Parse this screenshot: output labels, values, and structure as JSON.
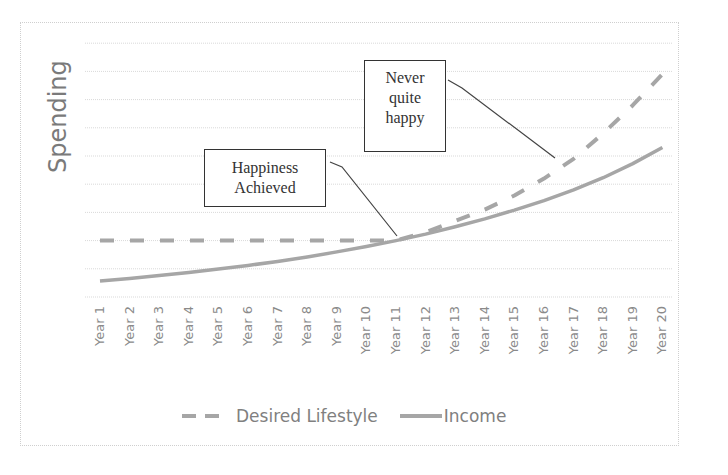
{
  "chart_data": {
    "type": "line",
    "title": "",
    "xlabel": "",
    "ylabel": "Spending",
    "categories": [
      "Year 1",
      "Year 2",
      "Year 3",
      "Year 4",
      "Year 5",
      "Year 6",
      "Year 7",
      "Year 8",
      "Year 9",
      "Year 10",
      "Year 11",
      "Year 12",
      "Year 13",
      "Year 14",
      "Year 15",
      "Year 16",
      "Year 17",
      "Year 18",
      "Year 19",
      "Year 20"
    ],
    "series": [
      {
        "name": "Desired Lifestyle",
        "style": "dashed",
        "color": "#a6a6a6",
        "values": [
          2.0,
          2.0,
          2.0,
          2.0,
          2.0,
          2.0,
          2.0,
          2.0,
          2.0,
          2.0,
          2.0,
          2.3,
          2.7,
          3.1,
          3.6,
          4.2,
          4.9,
          5.8,
          6.8,
          7.9
        ]
      },
      {
        "name": "Income",
        "style": "solid",
        "color": "#a6a6a6",
        "values": [
          0.57,
          0.66,
          0.76,
          0.87,
          0.99,
          1.12,
          1.26,
          1.42,
          1.6,
          1.79,
          2.0,
          2.23,
          2.49,
          2.77,
          3.08,
          3.42,
          3.8,
          4.23,
          4.73,
          5.3
        ]
      }
    ],
    "ylim": [
      0,
      9
    ],
    "y_tick_labels": [],
    "grid": true,
    "legend_position": "bottom",
    "annotations": [
      {
        "text": "Happiness Achieved",
        "points_to": "Year 11"
      },
      {
        "text": "Never quite happy",
        "points_to": "Year 17"
      }
    ]
  },
  "annotations": {
    "happiness": {
      "line1": "Happiness",
      "line2": "Achieved"
    },
    "never": {
      "line1": "Never",
      "line2": "quite",
      "line3": "happy"
    }
  },
  "legend": {
    "desired": "Desired Lifestyle",
    "income": "Income"
  }
}
